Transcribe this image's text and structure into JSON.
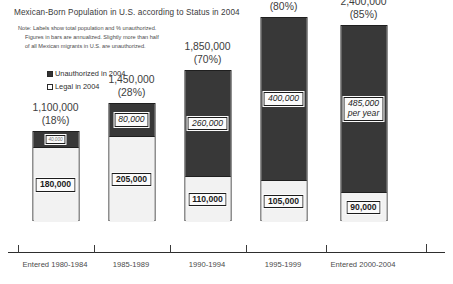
{
  "chart_data": {
    "type": "bar",
    "subtype": "stacked-bar",
    "title": "Mexican-Born Population in U.S. according to Status in 2004",
    "note": {
      "line1": "Note:  Labels show  total population and % unauthorized.",
      "line2": "Figures in bars are annualized.  Slightly more than half",
      "line3": "of all Mexican migrants in U.S. are unauthorized."
    },
    "xlabel": "",
    "ylabel": "",
    "grid": false,
    "legend_position": "upper-left",
    "legend": [
      {
        "label": "Unauthorized in 2004",
        "color": "#383838",
        "swatch": "dark"
      },
      {
        "label": "Legal in 2004",
        "color": "#ffffff",
        "swatch": "light"
      }
    ],
    "categories": [
      "Entered 1980-1984",
      "1985-1989",
      "1990-1994",
      "1995-1999",
      "Entered 2000-2004"
    ],
    "totals": [
      1100000,
      1450000,
      1850000,
      2500000,
      2400000
    ],
    "total_labels": [
      "1,100,000",
      "1,450,000",
      "1,850,000",
      "2,500,000",
      "2,400,000"
    ],
    "percent_unauthorized": [
      18,
      28,
      70,
      80,
      85
    ],
    "percent_labels": [
      "(18%)",
      "(28%)",
      "(70%)",
      "(80%)",
      "(85%)"
    ],
    "series": [
      {
        "name": "Unauthorized in 2004",
        "values": [
          40000,
          80000,
          260000,
          400000,
          485000
        ],
        "value_labels": [
          "40,000",
          "80,000",
          "260,000",
          "400,000",
          "485,000"
        ],
        "value_sublabels": [
          "",
          "",
          "",
          "",
          "per year"
        ]
      },
      {
        "name": "Legal in 2004",
        "values": [
          180000,
          205000,
          110000,
          105000,
          90000
        ],
        "value_labels": [
          "180,000",
          "205,000",
          "110,000",
          "105,000",
          "90,000"
        ],
        "value_sublabels": [
          "",
          "",
          "",
          "",
          ""
        ]
      }
    ],
    "ylim": [
      0,
      2500000
    ],
    "colors": {
      "unauthorized": "#383838",
      "legal": "#f2f2f2",
      "outline": "#1f1f1f",
      "text": "#3d3d3d",
      "axis": "#2e2e2e"
    }
  }
}
